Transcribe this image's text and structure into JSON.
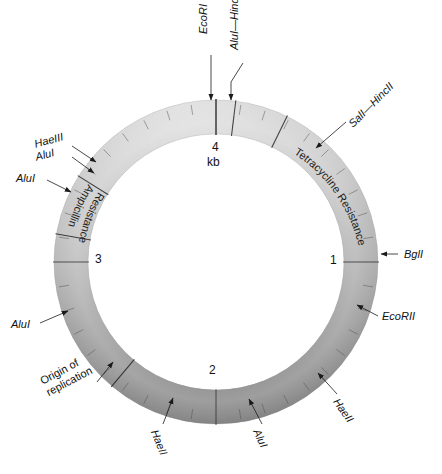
{
  "figure": {
    "type": "plasmid-map",
    "unit_label": "kb",
    "ring": {
      "center_x": 216,
      "center_y": 262,
      "outer_radius": 162,
      "inner_radius": 128,
      "total_kb": 4,
      "tick_count": 40
    }
  },
  "scale_numbers": [
    {
      "label": "4",
      "x": 212,
      "y": 148
    },
    {
      "label": "kb",
      "x": 209,
      "y": 163
    },
    {
      "label": "1",
      "x": 330,
      "y": 255
    },
    {
      "label": "2",
      "x": 211,
      "y": 366
    },
    {
      "label": "3",
      "x": 95,
      "y": 254
    }
  ],
  "region_labels": [
    {
      "name": "ampicillin-resistance",
      "line1": "Ampicillin",
      "line2": "Resistance"
    },
    {
      "name": "tetracycline-resistance",
      "text": "Tetracycline Resistance"
    }
  ],
  "site_labels": [
    {
      "name": "ecori",
      "text": "EcoRI",
      "italic": "EcoR",
      "roman": "I",
      "x": 203,
      "y": 30,
      "rotate": -90
    },
    {
      "name": "alui-hindii",
      "text": "AluI—HindII",
      "italic": "Alu",
      "roman": "I—",
      "x": 233,
      "y": 22,
      "rotate": -90
    },
    {
      "name": "sali-hincii",
      "text": "SalI—HincII",
      "x": 352,
      "y": 115,
      "rotate": -45
    },
    {
      "name": "bgli",
      "text": "BglI",
      "x": 406,
      "y": 256,
      "rotate": 0
    },
    {
      "name": "ecorii",
      "text": "EcoRII",
      "x": 380,
      "y": 314,
      "rotate": 0
    },
    {
      "name": "haeii-right",
      "text": "HaeII",
      "x": 340,
      "y": 398,
      "rotate": -55
    },
    {
      "name": "alui-bottom",
      "text": "AluI",
      "x": 262,
      "y": 432,
      "rotate": -65
    },
    {
      "name": "haeii-bottom",
      "text": "HaeII",
      "x": 155,
      "y": 428,
      "rotate": -68
    },
    {
      "name": "origin-of-replication",
      "line1": "Origin of",
      "line2": "replication",
      "x": 50,
      "y": 382,
      "rotate": -28
    },
    {
      "name": "alui-left",
      "text": "AluI",
      "x": 13,
      "y": 327,
      "rotate": 0
    },
    {
      "name": "alui-upperleft",
      "text": "AluI",
      "x": 17,
      "y": 178,
      "rotate": 0
    },
    {
      "name": "haeiii",
      "text": "HaeIII",
      "x": 35,
      "y": 141,
      "rotate": -18
    },
    {
      "name": "alui-upper2",
      "text": "AluI",
      "x": 36,
      "y": 153,
      "rotate": -18
    }
  ],
  "colors": {
    "ring_light": "#dcdcdc",
    "ring_mid": "#b4b4b4",
    "ring_dark": "#6e6e6e",
    "ring_darkest": "#4a4a4a",
    "text": "#111111",
    "background": "#ffffff",
    "arrow": "#1a1a1a"
  },
  "chart_data": {
    "type": "pie",
    "title": "",
    "categories": [
      "Ampicillin Resistance",
      "Tetracycline Resistance",
      "Origin of replication",
      "Unlabeled backbone"
    ],
    "values": [
      0.9,
      1.4,
      0.1,
      1.6
    ],
    "axis_unit": "kb",
    "axis_ticks": [
      "1",
      "2",
      "3",
      "4"
    ],
    "legend": "none"
  }
}
